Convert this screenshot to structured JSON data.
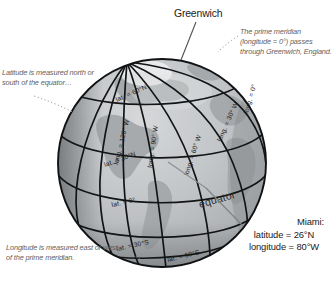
{
  "labels": {
    "greenwich": "Greenwich",
    "equator": "equator"
  },
  "annotations": {
    "latitude_note": "Latitude is measured north or south of the equator…",
    "longitude_note": "Longitude is measured east or west of the prime meridian.",
    "prime_meridian_note": "The prime meridian (longitude = 0°) passes through Greenwich, England."
  },
  "callouts": {
    "miami": {
      "title": "Miami:",
      "latitude": "latitude = 26°N",
      "longitude": "longitude = 80°W"
    }
  },
  "grid_labels": {
    "latitudes": [
      {
        "id": "lat-60n",
        "text": "lat. = 60°N"
      },
      {
        "id": "lat-30n",
        "text": "lat. = 30°N"
      },
      {
        "id": "lat-0",
        "text": "lat. = 0°"
      },
      {
        "id": "lat-30s",
        "text": "lat. = 30°S"
      },
      {
        "id": "lat-60s",
        "text": "lat. = 60°S"
      }
    ],
    "longitudes": [
      {
        "id": "long-0",
        "text": "long. = 0°"
      },
      {
        "id": "long-30w",
        "text": "long. = 30° W"
      },
      {
        "id": "long-60w",
        "text": "long. = 60° W"
      },
      {
        "id": "long-90w",
        "text": "long. = 90° W"
      },
      {
        "id": "long-120w",
        "text": "long. = 120° W"
      }
    ]
  },
  "colors": {
    "ocean_light": "#c9cbcd",
    "ocean_mid": "#b4b7ba",
    "ocean_dark": "#8d9093",
    "land": "#a7aaad",
    "gridline": "#121416",
    "outline": "#101214",
    "annotation_text": "#5f5f5f",
    "callout_text": "#1a1a1a",
    "leader_line": "#808386",
    "background": "#ffffff"
  }
}
